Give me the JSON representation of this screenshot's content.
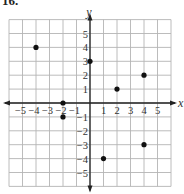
{
  "problem": {
    "number": "16."
  },
  "chart_data": {
    "type": "scatter",
    "title": "",
    "xlabel": "x",
    "ylabel": "y",
    "xlim": [
      -6,
      6
    ],
    "ylim": [
      -6,
      6
    ],
    "grid": true,
    "x_ticks": [
      -5,
      -4,
      -3,
      -2,
      -1,
      1,
      2,
      3,
      4,
      5
    ],
    "y_ticks": [
      -5,
      -4,
      -3,
      -2,
      -1,
      1,
      2,
      3,
      4,
      5
    ],
    "x_tick_labels": [
      "−5",
      "−4",
      "−3",
      "−2",
      "−1",
      "1",
      "2",
      "3",
      "4",
      "5"
    ],
    "y_tick_labels": [
      "−5",
      "−4",
      "−3",
      "−2",
      "−1",
      "1",
      "2",
      "3",
      "4",
      "5"
    ],
    "points": [
      {
        "x": -4,
        "y": 4
      },
      {
        "x": 0,
        "y": 3
      },
      {
        "x": 4,
        "y": 2
      },
      {
        "x": 2,
        "y": 1
      },
      {
        "x": -2,
        "y": 0
      },
      {
        "x": -2,
        "y": -1
      },
      {
        "x": 4,
        "y": -3
      },
      {
        "x": 1,
        "y": -4
      }
    ]
  },
  "colors": {
    "grid": "#b4b4b4",
    "axis": "#222222",
    "point": "#111111"
  }
}
